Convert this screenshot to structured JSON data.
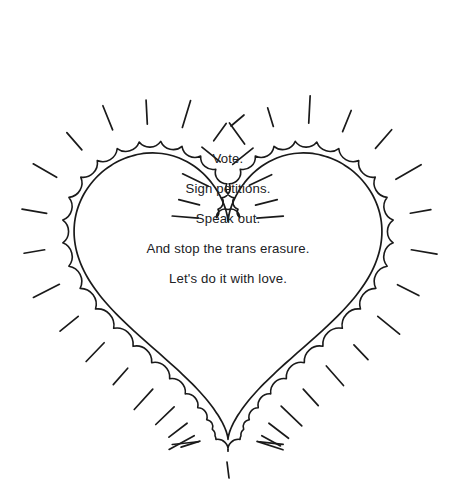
{
  "artwork": {
    "title": "Hand-drawn radiating heart with message",
    "background_color": "#ffffff",
    "stroke_color": "#1a1a1a",
    "text_color": "#202124",
    "stroke_width": 1.6,
    "sparkle_stroke_width": 1.7
  },
  "heart": {
    "inner_outline_name": "inner-heart-outline",
    "scallop_border_name": "scalloped-heart-border",
    "scallop_count": 58,
    "scallop_offset_px": 12,
    "scallop_radius_px": 7,
    "center_x": 228,
    "top_cleft_y": 126,
    "bottom_tip_y": 443,
    "left_extent_x": 70,
    "right_extent_x": 378
  },
  "sparkles": {
    "name": "radiating-dashes",
    "count": 44,
    "inner_gap_px": 18,
    "length_px": 26,
    "description": "short straight dashes radiating outward from the scalloped heart border"
  },
  "message": {
    "center_x": 228,
    "line_height": 30,
    "first_line_y": 163,
    "lines": [
      "Vote.",
      "Sign petitions.",
      "Speak out.",
      "And stop the trans erasure.",
      "Let's do it with love."
    ]
  }
}
